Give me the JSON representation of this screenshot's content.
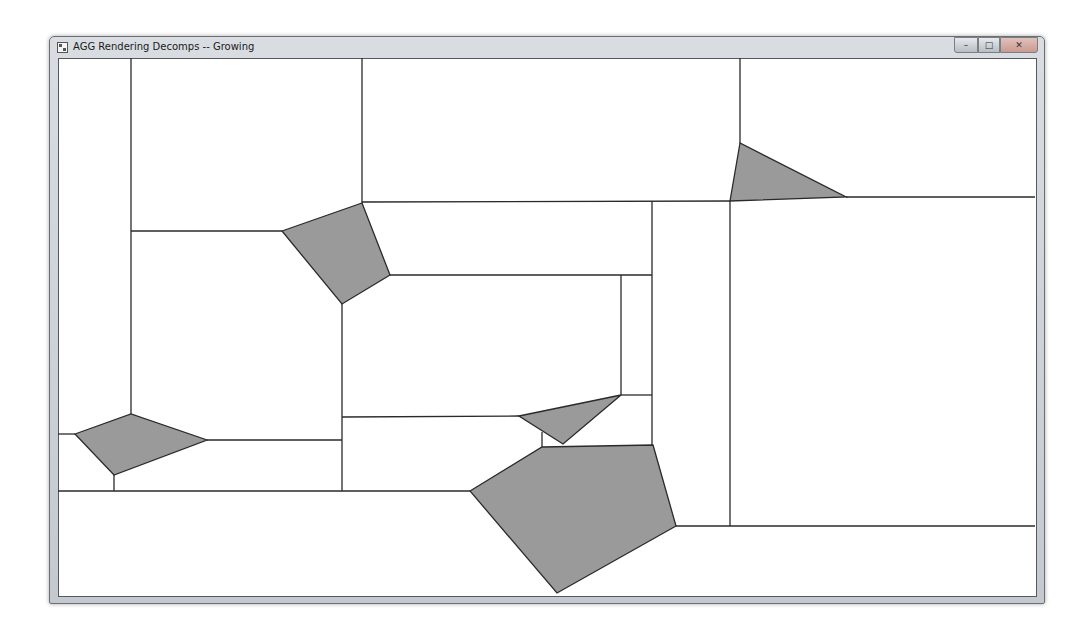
{
  "window": {
    "title": "AGG Rendering Decomps -- Growing",
    "controls": {
      "minimize": "–",
      "maximize": "□",
      "close": "✕"
    }
  },
  "canvas": {
    "line_color": "#2a2a2a",
    "fill_color": "#9a9a9a",
    "background": "#ffffff",
    "polygons": [
      {
        "name": "polygon-left",
        "points": "75,434 131,414 207,440 114,475"
      },
      {
        "name": "polygon-upper-mid",
        "points": "282,231 362,203 390,275 342,304"
      },
      {
        "name": "polygon-upper-right",
        "points": "740,143 730,201 846,197"
      },
      {
        "name": "polygon-small-mid",
        "points": "519,416 621,395 563,444"
      },
      {
        "name": "polygon-large-bottom",
        "points": "470,491 542,447 653,445 676,526 557,593"
      }
    ],
    "lines": [
      {
        "x1": 131,
        "y1": 58,
        "x2": 131,
        "y2": 414
      },
      {
        "x1": 362,
        "y1": 58,
        "x2": 362,
        "y2": 203
      },
      {
        "x1": 740,
        "y1": 58,
        "x2": 740,
        "y2": 143
      },
      {
        "x1": 131,
        "y1": 231,
        "x2": 282,
        "y2": 231
      },
      {
        "x1": 362,
        "y1": 202,
        "x2": 730,
        "y2": 201
      },
      {
        "x1": 846,
        "y1": 197,
        "x2": 1035,
        "y2": 197
      },
      {
        "x1": 730,
        "y1": 201,
        "x2": 730,
        "y2": 526
      },
      {
        "x1": 652,
        "y1": 201,
        "x2": 652,
        "y2": 445
      },
      {
        "x1": 390,
        "y1": 275,
        "x2": 652,
        "y2": 275
      },
      {
        "x1": 621,
        "y1": 275,
        "x2": 621,
        "y2": 395
      },
      {
        "x1": 621,
        "y1": 395,
        "x2": 652,
        "y2": 395
      },
      {
        "x1": 342,
        "y1": 304,
        "x2": 342,
        "y2": 491
      },
      {
        "x1": 342,
        "y1": 417,
        "x2": 519,
        "y2": 416
      },
      {
        "x1": 542,
        "y1": 432,
        "x2": 542,
        "y2": 447
      },
      {
        "x1": 207,
        "y1": 440,
        "x2": 342,
        "y2": 440
      },
      {
        "x1": 58,
        "y1": 434,
        "x2": 75,
        "y2": 434
      },
      {
        "x1": 114,
        "y1": 475,
        "x2": 114,
        "y2": 491
      },
      {
        "x1": 58,
        "y1": 491,
        "x2": 470,
        "y2": 491
      },
      {
        "x1": 676,
        "y1": 526,
        "x2": 1035,
        "y2": 526
      }
    ]
  }
}
